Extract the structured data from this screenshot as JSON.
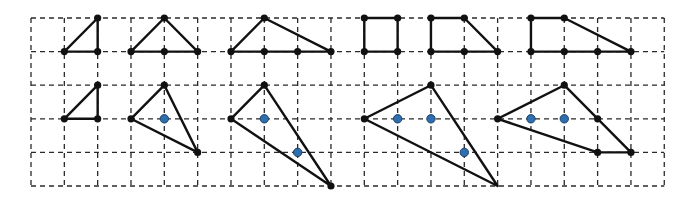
{
  "grid": {
    "origin_x": 31,
    "origin_y": 18,
    "cell_w": 33.33,
    "cell_h": 33.6,
    "cols": 19,
    "rows": 5,
    "line_color": "#2a2a2a",
    "dash": "5,4"
  },
  "colors": {
    "edge": "#111111",
    "vertex": "#111111",
    "marker": "#2f6fb0",
    "marker_outline": "#1a3f66"
  },
  "figures": [
    {
      "name": "top-figure-1",
      "polygon": [
        [
          1,
          1
        ],
        [
          2,
          0
        ],
        [
          2,
          1
        ]
      ],
      "points": [
        [
          1,
          1
        ],
        [
          2,
          0
        ],
        [
          2,
          1
        ]
      ],
      "markers": []
    },
    {
      "name": "top-figure-2",
      "polygon": [
        [
          3,
          1
        ],
        [
          4,
          0
        ],
        [
          5,
          1
        ]
      ],
      "points": [
        [
          3,
          1
        ],
        [
          4,
          0
        ],
        [
          5,
          1
        ],
        [
          4,
          1
        ]
      ],
      "markers": []
    },
    {
      "name": "top-figure-3",
      "polygon": [
        [
          6,
          1
        ],
        [
          7,
          0
        ],
        [
          9,
          1
        ]
      ],
      "points": [
        [
          6,
          1
        ],
        [
          7,
          0
        ],
        [
          9,
          1
        ],
        [
          7,
          1
        ],
        [
          8,
          1
        ]
      ],
      "markers": []
    },
    {
      "name": "top-figure-4",
      "polygon": [
        [
          10,
          0
        ],
        [
          11,
          0
        ],
        [
          11,
          1
        ],
        [
          10,
          1
        ]
      ],
      "points": [
        [
          10,
          0
        ],
        [
          11,
          0
        ],
        [
          11,
          1
        ],
        [
          10,
          1
        ]
      ],
      "markers": []
    },
    {
      "name": "top-figure-5",
      "polygon": [
        [
          12,
          0
        ],
        [
          13,
          0
        ],
        [
          14,
          1
        ],
        [
          12,
          1
        ]
      ],
      "points": [
        [
          12,
          0
        ],
        [
          13,
          0
        ],
        [
          14,
          1
        ],
        [
          12,
          1
        ],
        [
          13,
          1
        ]
      ],
      "markers": []
    },
    {
      "name": "top-figure-6",
      "polygon": [
        [
          15,
          0
        ],
        [
          16,
          0
        ],
        [
          18,
          1
        ],
        [
          15,
          1
        ]
      ],
      "points": [
        [
          15,
          0
        ],
        [
          16,
          0
        ],
        [
          18,
          1
        ],
        [
          15,
          1
        ],
        [
          16,
          1
        ],
        [
          17,
          1
        ]
      ],
      "markers": []
    },
    {
      "name": "bottom-figure-1",
      "polygon": [
        [
          1,
          3
        ],
        [
          2,
          2
        ],
        [
          2,
          3
        ]
      ],
      "points": [
        [
          1,
          3
        ],
        [
          2,
          2
        ],
        [
          2,
          3
        ]
      ],
      "markers": []
    },
    {
      "name": "bottom-figure-2",
      "polygon": [
        [
          3,
          3
        ],
        [
          4,
          2
        ],
        [
          5,
          4
        ]
      ],
      "points": [
        [
          3,
          3
        ],
        [
          4,
          2
        ],
        [
          5,
          4
        ]
      ],
      "markers": [
        [
          4,
          3
        ]
      ]
    },
    {
      "name": "bottom-figure-3",
      "polygon": [
        [
          6,
          3
        ],
        [
          7,
          2
        ],
        [
          9,
          5
        ]
      ],
      "points": [
        [
          6,
          3
        ],
        [
          7,
          2
        ],
        [
          9,
          5
        ]
      ],
      "markers": [
        [
          7,
          3
        ],
        [
          8,
          4
        ]
      ]
    },
    {
      "name": "bottom-figure-4",
      "polygon": [
        [
          10,
          3
        ],
        [
          12,
          2
        ],
        [
          14,
          5
        ]
      ],
      "points": [
        [
          10,
          3
        ],
        [
          12,
          2
        ]
      ],
      "markers": [
        [
          11,
          3
        ],
        [
          12,
          3
        ],
        [
          13,
          4
        ]
      ]
    },
    {
      "name": "bottom-figure-5",
      "polygon": [
        [
          14,
          3
        ],
        [
          16,
          2
        ],
        [
          18,
          4
        ],
        [
          17,
          4
        ]
      ],
      "points": [
        [
          14,
          3
        ],
        [
          16,
          2
        ],
        [
          18,
          4
        ],
        [
          17,
          4
        ],
        [
          17,
          3
        ]
      ],
      "markers": [
        [
          15,
          3
        ],
        [
          16,
          3
        ]
      ]
    }
  ]
}
